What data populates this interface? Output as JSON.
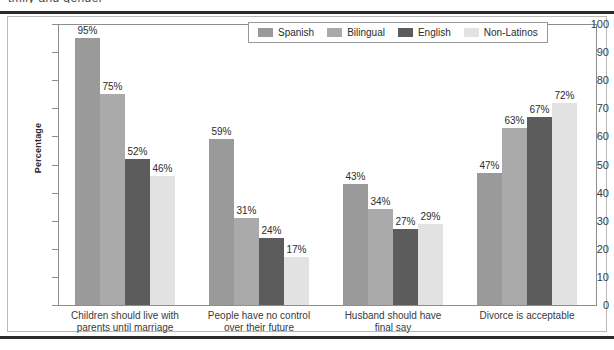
{
  "caption_fragment": "tmily and gender",
  "chart_data": {
    "type": "bar",
    "title": "",
    "xlabel": "",
    "ylabel": "Percentage",
    "ylim": [
      0,
      100
    ],
    "ytick_step": 10,
    "yticks": [
      "100",
      "90",
      "80",
      "70",
      "60",
      "50",
      "40",
      "30",
      "20",
      "10",
      "0"
    ],
    "grid": false,
    "legend_position": "top-center",
    "value_label_suffix": "%",
    "categories": [
      "Children should live with parents until marriage",
      "People have no control over their future",
      "Husband should have final say",
      "Divorce is acceptable"
    ],
    "category_lines": [
      [
        "Children should live with",
        "parents until marriage"
      ],
      [
        "People have no control",
        "over their future"
      ],
      [
        "Husband should have",
        "final say"
      ],
      [
        "Divorce is acceptable"
      ]
    ],
    "series": [
      {
        "name": "Spanish",
        "color": "#9a9a9a",
        "values": [
          95,
          59,
          43,
          47
        ],
        "labels": [
          "95%",
          "59%",
          "43%",
          "47%"
        ]
      },
      {
        "name": "Bilingual",
        "color": "#aaaaaa",
        "values": [
          75,
          31,
          34,
          63
        ],
        "labels": [
          "75%",
          "31%",
          "34%",
          "63%"
        ]
      },
      {
        "name": "English",
        "color": "#5c5c5c",
        "values": [
          52,
          24,
          27,
          67
        ],
        "labels": [
          "52%",
          "24%",
          "27%",
          "67%"
        ]
      },
      {
        "name": "Non-Latinos",
        "color": "#e2e2e2",
        "values": [
          46,
          17,
          29,
          72
        ],
        "labels": [
          "46%",
          "17%",
          "29%",
          "72%"
        ]
      }
    ]
  }
}
